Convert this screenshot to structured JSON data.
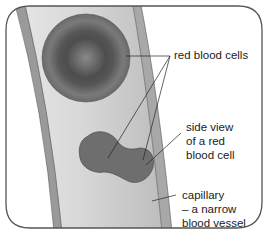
{
  "diagram": {
    "labels": {
      "red_blood_cells": "red blood cells",
      "side_view_line1": "side view",
      "side_view_line2": "of a red",
      "side_view_line3": "blood cell",
      "capillary_line1": "capillary",
      "capillary_line2": "– a narrow",
      "capillary_line3": "blood vessel"
    },
    "colors": {
      "frame": "#555555",
      "vessel_wall": "#9a9a9a",
      "vessel_inner": "#cfcfcf",
      "cell_face": "#6e6e6e",
      "cell_side": "#6a6a6a",
      "background": "#ffffff"
    }
  }
}
